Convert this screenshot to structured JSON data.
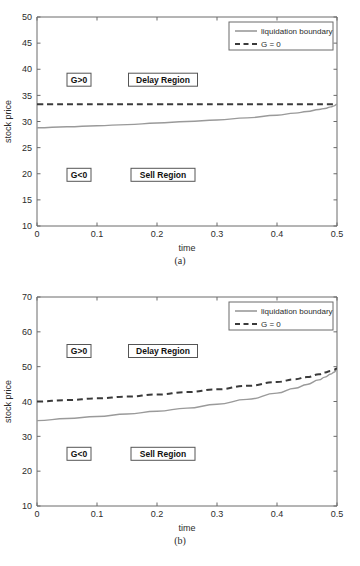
{
  "figure": {
    "panels": [
      {
        "caption": "(a)",
        "chart_index": 0
      },
      {
        "caption": "(b)",
        "chart_index": 1
      }
    ]
  },
  "chart_data": [
    {
      "type": "line",
      "title": "",
      "xlabel": "time",
      "ylabel": "stock price",
      "xlim": [
        0,
        0.5
      ],
      "ylim": [
        10,
        50
      ],
      "grid": false,
      "xticks": [
        0,
        0.1,
        0.2,
        0.3,
        0.4,
        0.5
      ],
      "xticklabels": [
        "0",
        "0.1",
        "0.2",
        "0.3",
        "0.4",
        "0.5"
      ],
      "yticks": [
        10,
        15,
        20,
        25,
        30,
        35,
        40,
        45,
        50
      ],
      "yticklabels": [
        "10",
        "15",
        "20",
        "25",
        "30",
        "35",
        "40",
        "45",
        "50"
      ],
      "legend_position": "upper right",
      "series": [
        {
          "name": "liquidation boundary",
          "style": "solid",
          "color": "#9a9a9a",
          "x": [
            0,
            0.05,
            0.1,
            0.15,
            0.2,
            0.25,
            0.3,
            0.35,
            0.4,
            0.43,
            0.45,
            0.47,
            0.48,
            0.49,
            0.495,
            0.5
          ],
          "y": [
            28.8,
            29.0,
            29.2,
            29.4,
            29.7,
            30.0,
            30.3,
            30.7,
            31.2,
            31.6,
            31.9,
            32.3,
            32.5,
            32.8,
            33.0,
            33.3
          ]
        },
        {
          "name": "G = 0",
          "style": "dashed",
          "color": "#3a3a3a",
          "x": [
            0,
            0.1,
            0.2,
            0.3,
            0.4,
            0.45,
            0.5
          ],
          "y": [
            33.3,
            33.3,
            33.3,
            33.3,
            33.3,
            33.3,
            33.3
          ]
        }
      ],
      "annotations": [
        {
          "text": "G>0",
          "x": 0.07,
          "y": 38.0
        },
        {
          "text": "Delay Region",
          "x": 0.21,
          "y": 38.0
        },
        {
          "text": "G<0",
          "x": 0.07,
          "y": 19.8
        },
        {
          "text": "Sell Region",
          "x": 0.21,
          "y": 19.8
        }
      ]
    },
    {
      "type": "line",
      "title": "",
      "xlabel": "time",
      "ylabel": "stock price",
      "xlim": [
        0,
        0.5
      ],
      "ylim": [
        10,
        70
      ],
      "grid": false,
      "xticks": [
        0,
        0.1,
        0.2,
        0.3,
        0.4,
        0.5
      ],
      "xticklabels": [
        "0",
        "0.1",
        "0.2",
        "0.3",
        "0.4",
        "0.5"
      ],
      "yticks": [
        10,
        20,
        30,
        40,
        50,
        60,
        70
      ],
      "yticklabels": [
        "10",
        "20",
        "30",
        "40",
        "50",
        "60",
        "70"
      ],
      "legend_position": "upper right",
      "series": [
        {
          "name": "liquidation boundary",
          "style": "solid",
          "color": "#9a9a9a",
          "x": [
            0,
            0.05,
            0.1,
            0.15,
            0.2,
            0.25,
            0.3,
            0.35,
            0.4,
            0.43,
            0.45,
            0.47,
            0.48,
            0.49,
            0.495,
            0.5
          ],
          "y": [
            34.5,
            35.1,
            35.7,
            36.4,
            37.2,
            38.1,
            39.2,
            40.6,
            42.4,
            43.8,
            44.9,
            46.2,
            47.0,
            47.9,
            48.4,
            49.2
          ]
        },
        {
          "name": "G = 0",
          "style": "dashed",
          "color": "#3a3a3a",
          "x": [
            0,
            0.05,
            0.1,
            0.15,
            0.2,
            0.25,
            0.3,
            0.35,
            0.4,
            0.43,
            0.45,
            0.47,
            0.48,
            0.49,
            0.495,
            0.5
          ],
          "y": [
            40.0,
            40.4,
            40.9,
            41.4,
            42.0,
            42.7,
            43.5,
            44.5,
            45.6,
            46.4,
            47.0,
            47.8,
            48.3,
            48.8,
            49.1,
            49.5
          ]
        }
      ],
      "annotations": [
        {
          "text": "G>0",
          "x": 0.07,
          "y": 54.5
        },
        {
          "text": "Delay Region",
          "x": 0.21,
          "y": 54.5
        },
        {
          "text": "G<0",
          "x": 0.07,
          "y": 25.0
        },
        {
          "text": "Sell Region",
          "x": 0.21,
          "y": 25.0
        }
      ]
    }
  ]
}
